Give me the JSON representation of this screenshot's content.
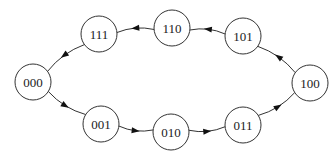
{
  "diagram": {
    "type": "state-cycle",
    "direction": "counter-clockwise",
    "nodes": [
      {
        "id": "000",
        "label": "000"
      },
      {
        "id": "001",
        "label": "001"
      },
      {
        "id": "010",
        "label": "010"
      },
      {
        "id": "011",
        "label": "011"
      },
      {
        "id": "100",
        "label": "100"
      },
      {
        "id": "101",
        "label": "101"
      },
      {
        "id": "110",
        "label": "110"
      },
      {
        "id": "111",
        "label": "111"
      }
    ],
    "edges": [
      {
        "from": "000",
        "to": "001"
      },
      {
        "from": "001",
        "to": "010"
      },
      {
        "from": "010",
        "to": "011"
      },
      {
        "from": "011",
        "to": "100"
      },
      {
        "from": "100",
        "to": "101"
      },
      {
        "from": "101",
        "to": "110"
      },
      {
        "from": "110",
        "to": "111"
      },
      {
        "from": "111",
        "to": "000"
      }
    ]
  }
}
